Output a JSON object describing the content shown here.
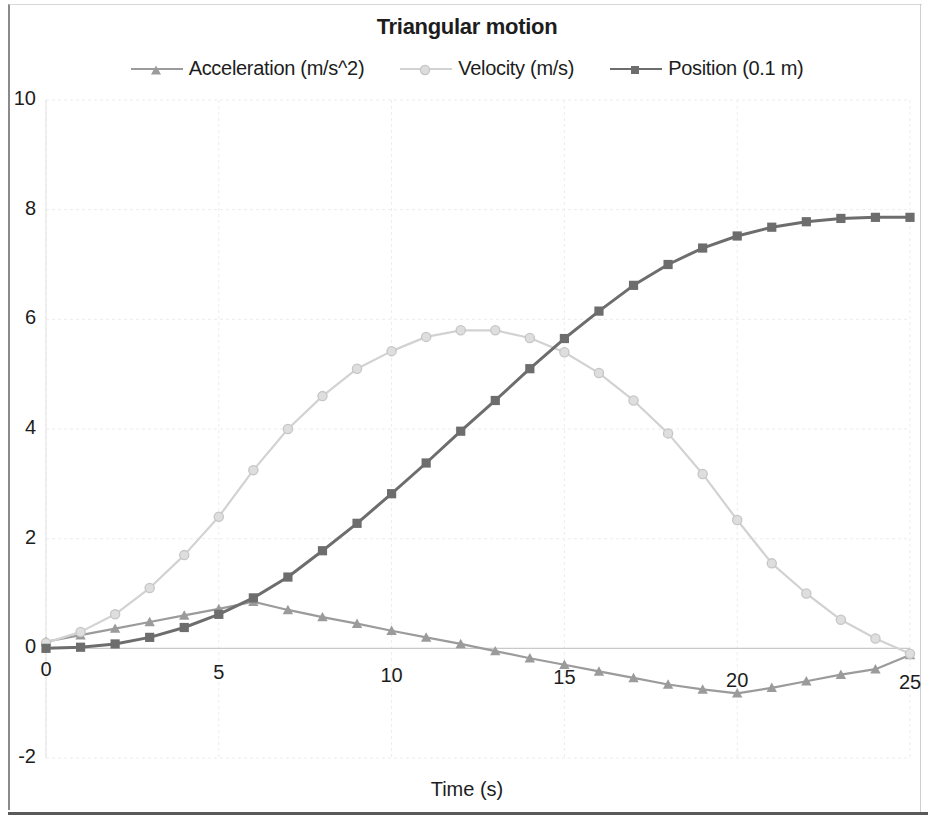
{
  "chart_data": {
    "type": "line",
    "title": "Triangular motion",
    "xlabel": "Time (s)",
    "ylabel": "",
    "xlim": [
      0,
      25
    ],
    "ylim": [
      -2,
      10
    ],
    "grid": true,
    "legend_position": "top",
    "x_ticks": [
      "0",
      "5",
      "10",
      "15",
      "20",
      "25"
    ],
    "x_tick_values": [
      0,
      5,
      10,
      15,
      20,
      25
    ],
    "y_ticks": [
      "10",
      "8",
      "6",
      "4",
      "2",
      "0",
      "-2"
    ],
    "y_tick_values": [
      10,
      8,
      6,
      4,
      2,
      0,
      -2
    ],
    "x": [
      0,
      1,
      2,
      3,
      4,
      5,
      6,
      7,
      8,
      9,
      10,
      11,
      12,
      13,
      14,
      15,
      16,
      17,
      18,
      19,
      20,
      21,
      22,
      23,
      24,
      25
    ],
    "series": [
      {
        "name": "Acceleration (m/s^2)",
        "marker": "triangle",
        "color": "#9b9b9b",
        "values": [
          0.12,
          0.24,
          0.36,
          0.48,
          0.6,
          0.72,
          0.85,
          0.7,
          0.57,
          0.45,
          0.32,
          0.2,
          0.08,
          -0.05,
          -0.18,
          -0.3,
          -0.42,
          -0.54,
          -0.66,
          -0.75,
          -0.82,
          -0.72,
          -0.6,
          -0.48,
          -0.38,
          -0.12
        ]
      },
      {
        "name": "Velocity (m/s)",
        "marker": "circle",
        "color": "#d2d2d2",
        "values": [
          0.1,
          0.3,
          0.62,
          1.1,
          1.7,
          2.4,
          3.25,
          4.0,
          4.6,
          5.1,
          5.42,
          5.68,
          5.8,
          5.8,
          5.66,
          5.4,
          5.02,
          4.52,
          3.92,
          3.18,
          2.34,
          1.55,
          1.0,
          0.52,
          0.18,
          -0.1
        ]
      },
      {
        "name": "Position (0.1 m)",
        "marker": "square",
        "color": "#6d6d6d",
        "values": [
          0.0,
          0.02,
          0.08,
          0.2,
          0.38,
          0.62,
          0.92,
          1.3,
          1.78,
          2.28,
          2.82,
          3.38,
          3.96,
          4.52,
          5.1,
          5.65,
          6.15,
          6.62,
          7.0,
          7.3,
          7.52,
          7.68,
          7.78,
          7.84,
          7.86,
          7.86
        ]
      }
    ]
  }
}
